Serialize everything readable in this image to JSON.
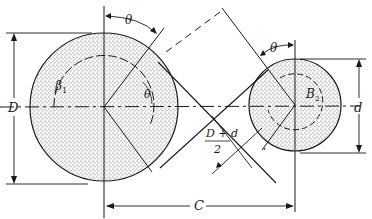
{
  "diagram": {
    "colors": {
      "ink": "#1a1a1a",
      "background": "#ffffff",
      "stipple": "#8a8a8a"
    },
    "labels": {
      "theta_top_left": "θ",
      "theta_top_right": "θ",
      "theta_inner": "θ",
      "beta1": "β",
      "beta1_sub": "1",
      "beta2": "B",
      "beta2_sub": "2",
      "large_diameter": "D",
      "small_diameter": "d",
      "center_distance": "C",
      "half_sum_num": "D + d",
      "half_sum_den": "2"
    },
    "pulleys": [
      {
        "name": "large-pulley",
        "label": "D"
      },
      {
        "name": "small-pulley",
        "label": "d"
      }
    ]
  }
}
